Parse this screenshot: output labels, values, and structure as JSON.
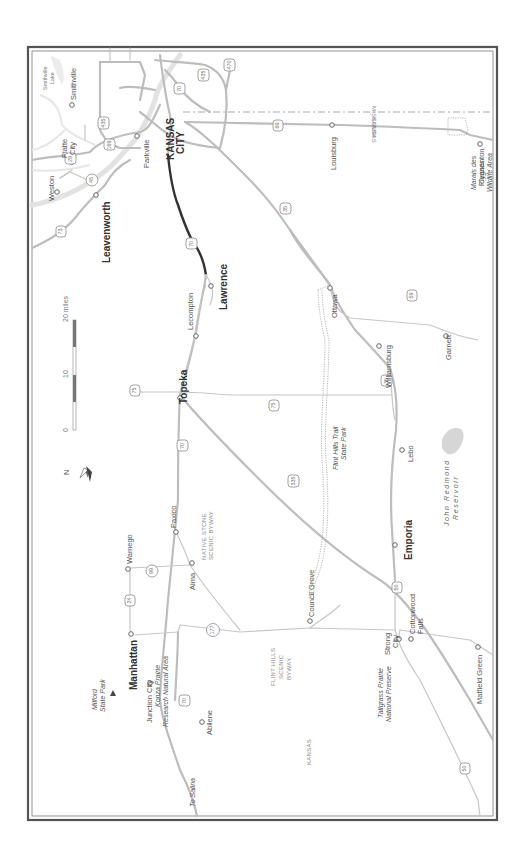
{
  "map": {
    "orientation": "rotated 90 degrees counter-clockwise",
    "north_arrow": {
      "label": "N"
    },
    "scale_bar": {
      "ticks": [
        "0",
        "10",
        "20 miles"
      ]
    },
    "highlighted_route": {
      "shield": "70",
      "from": "Lawrence",
      "to": "Kansas City"
    },
    "colors": {
      "route": "#333333",
      "roads": "#bdbdbd",
      "frame": "#555555",
      "water": "#e2e2e2"
    },
    "major_cities": {
      "kansas_city": "KANSAS",
      "kansas_city_2": "CITY",
      "leavenworth": "Leavenworth",
      "lawrence": "Lawrence",
      "topeka": "Topeka",
      "emporia": "Emporia",
      "manhattan": "Manhattan"
    },
    "towns": {
      "smithville": "Smithville",
      "platte_city_1": "Platte",
      "platte_city_2": "City",
      "parkville": "Parkville",
      "weston": "Weston",
      "louisburg": "Louisburg",
      "pleasanton": "Pleasanton",
      "lecompton": "Lecompton",
      "ottawa": "Ottawa",
      "williamsburg": "Williamsburg",
      "garnett": "Garnett",
      "lebo": "Lebo",
      "paxico": "Paxico",
      "wamego": "Wamego",
      "alma": "Alma",
      "council_grove": "Council Grove",
      "strong_city_1": "Strong",
      "strong_city_2": "City",
      "cottonwood_falls_1": "Cottonwood",
      "cottonwood_falls_2": "Falls",
      "matfield_green": "Matfield Green",
      "junction_city": "Junction City",
      "abilene": "Abilene",
      "to_salina": "To Salina"
    },
    "parks": {
      "smithville_lake_1": "Smithville",
      "smithville_lake_2": "Lake",
      "marais_1": "Marais des",
      "marais_2": "Cygnes",
      "marais_3": "Wildlife Area",
      "flint_hills_trail_1": "Flint Hills Trail",
      "flint_hills_trail_2": "State Park",
      "john_redmond_1": "John Redmond",
      "john_redmond_2": "Reservoir",
      "konza_1": "Konza Prairie",
      "konza_2": "Research Natural Area",
      "milford_1": "Milford",
      "milford_2": "State Park",
      "tallgrass_1": "Tallgrass Prairie",
      "tallgrass_2": "National Preserve"
    },
    "byways": {
      "native_stone_1": "NATIVE STONE",
      "native_stone_2": "SCENIC BYWAY",
      "flint_hills_1": "FLINT HILLS",
      "flint_hills_2": "SCENIC",
      "flint_hills_3": "BYWAY"
    },
    "states": {
      "missouri": "MISSOURI",
      "kansas_east": "KANSAS",
      "kansas_west": "KANSAS"
    },
    "shields": {
      "i29": "29",
      "us169": "169",
      "i435_n": "435",
      "i70_kc": "70",
      "i435_e": "435",
      "i470": "470",
      "k45": "45",
      "us73": "73",
      "us69": "69",
      "i35_n": "35",
      "i70_law": "70",
      "us75_n": "75",
      "i70_top": "70",
      "us75_s": "75",
      "i35_s": "35",
      "i335": "335",
      "us59": "59",
      "k99": "99",
      "us24": "24",
      "k177": "177",
      "us50_e": "50",
      "i70_w": "70",
      "us50_w": "50"
    }
  }
}
